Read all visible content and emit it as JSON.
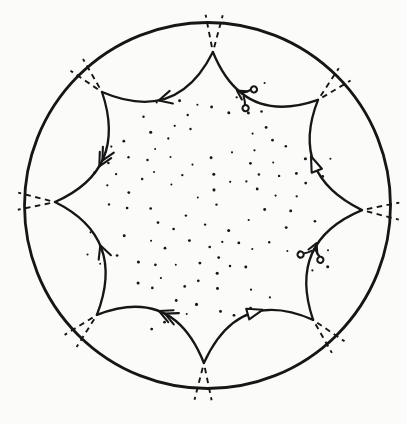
{
  "figure": {
    "ink": "#161616",
    "paper": "#fbfbf9",
    "disk": {
      "cx": 207.5,
      "cy": 205.5,
      "r": 183,
      "stroke_width": 2.8
    },
    "polygon": {
      "control_radius": 87,
      "edge_stroke_width": 2.3,
      "vertices": [
        {
          "angle": 88.0,
          "radius": 153.6
        },
        {
          "angle": 43.7,
          "radius": 152.8
        },
        {
          "angle": -1.7,
          "radius": 154.6
        },
        {
          "angle": -47.3,
          "radius": 155.7
        },
        {
          "angle": -91.3,
          "radius": 157.5
        },
        {
          "angle": -135.3,
          "radius": 155.6
        },
        {
          "angle": 178.7,
          "radius": 152.5
        },
        {
          "angle": 132.9,
          "radius": 155.0
        }
      ],
      "edges": [
        {
          "from": 0,
          "to": 1,
          "marker": {
            "type": "curl-arrow",
            "t": 0.42,
            "flip": true
          }
        },
        {
          "from": 1,
          "to": 2,
          "marker": {
            "type": "triangle",
            "t": 0.5,
            "flip": true
          }
        },
        {
          "from": 2,
          "to": 3,
          "marker": {
            "type": "curl-arrow",
            "t": 0.5,
            "flip": true
          }
        },
        {
          "from": 3,
          "to": 4,
          "marker": {
            "type": "triangle",
            "t": 0.45,
            "flip": true
          }
        },
        {
          "from": 4,
          "to": 5,
          "marker": {
            "type": "double-arrow",
            "t": 0.5,
            "flip": false
          }
        },
        {
          "from": 5,
          "to": 6,
          "marker": {
            "type": "arrow",
            "t": 0.5,
            "flip": false
          }
        },
        {
          "from": 6,
          "to": 7,
          "marker": {
            "type": "double-arrow",
            "t": 0.45,
            "flip": true
          }
        },
        {
          "from": 7,
          "to": 0,
          "marker": {
            "type": "arrow",
            "t": 0.45,
            "flip": true
          }
        }
      ]
    },
    "vertex_dashes": {
      "splay_deg": 13,
      "start_offset": 5,
      "length": 33,
      "dash": "5.5 4.5",
      "stroke_width": 1.9
    },
    "marker_style": {
      "stroke_width": 2.1
    },
    "stipple": {
      "seed": 13,
      "count": 112,
      "min_spacing": 13,
      "dot_radius": 1.2,
      "base_radius": 114,
      "bulge": 38,
      "vertex_period_deg": 45,
      "first_vertex_angle_deg": 88,
      "margin": 7
    }
  }
}
